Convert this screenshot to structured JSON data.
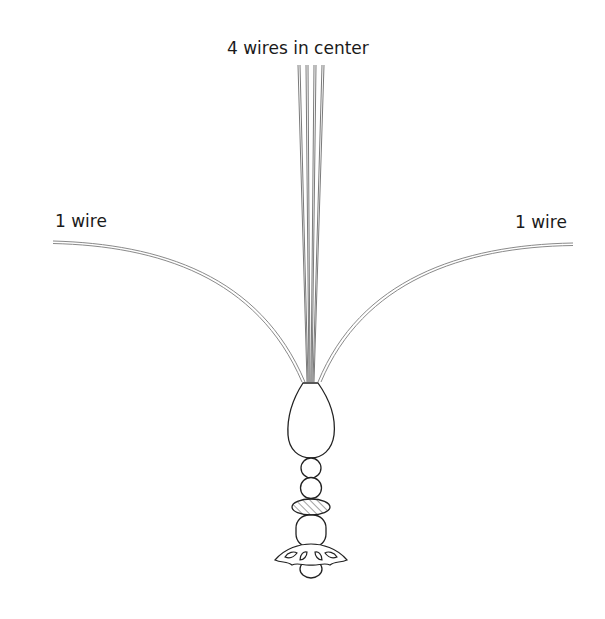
{
  "diagram": {
    "labels": {
      "center": "4 wires in center",
      "left": "1 wire",
      "right": "1 wire"
    },
    "components": [
      "wire-left",
      "wires-center-4",
      "wire-right",
      "teardrop-bead",
      "round-bead-small",
      "round-bead-medium",
      "hatched-rondelle",
      "round-bead-large",
      "flower-bead-cap",
      "end-bead"
    ],
    "colors": {
      "line": "#222222",
      "wire": "#888888",
      "background": "#ffffff"
    }
  }
}
